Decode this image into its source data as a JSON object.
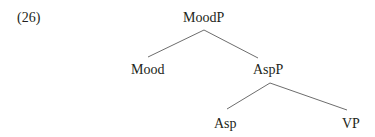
{
  "example": {
    "number": "(26)"
  },
  "tree": {
    "root": "MoodP",
    "nodes": {
      "moodp": "MoodP",
      "mood": "Mood",
      "aspp": "AspP",
      "asp": "Asp",
      "vp": "VP"
    },
    "edges": [
      [
        "MoodP",
        "Mood"
      ],
      [
        "MoodP",
        "AspP"
      ],
      [
        "AspP",
        "Asp"
      ],
      [
        "AspP",
        "VP"
      ]
    ]
  },
  "colors": {
    "text": "#231f20",
    "line": "#6d6d6d"
  }
}
